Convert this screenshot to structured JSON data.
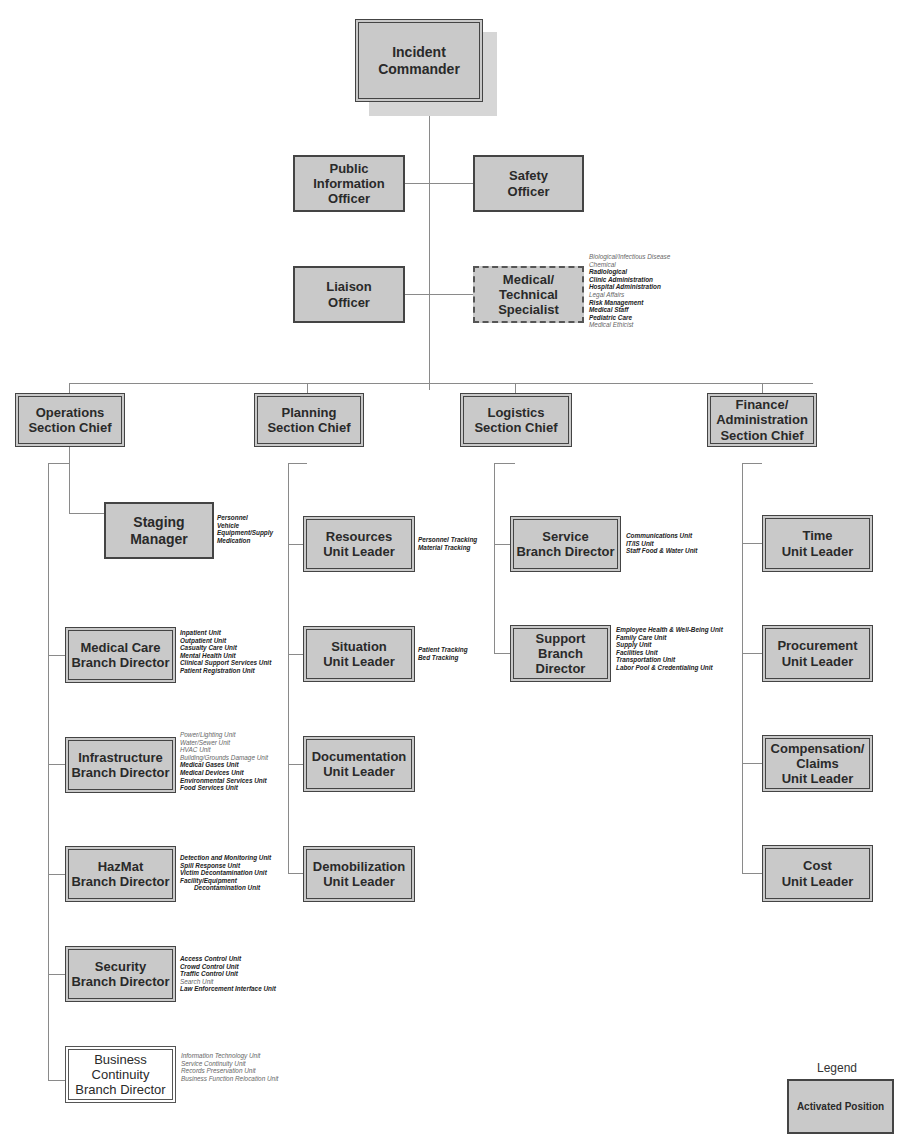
{
  "chart_title": "Hospital Incident Command System Organization Chart",
  "command": {
    "incident_commander": "Incident Commander",
    "public_information_officer": "Public\nInformation\nOfficer",
    "safety_officer": "Safety\nOfficer",
    "liaison_officer": "Liaison\nOfficer",
    "medical_technical_specialist": "Medical/\nTechnical\nSpecialist",
    "specialist_notes": [
      {
        "text": "Biological/Infectious Disease",
        "bold": false
      },
      {
        "text": "Chemical",
        "bold": false
      },
      {
        "text": "Radiological",
        "bold": true
      },
      {
        "text": "Clinic Administration",
        "bold": true
      },
      {
        "text": "Hospital Administration",
        "bold": true
      },
      {
        "text": "Legal Affairs",
        "bold": false
      },
      {
        "text": "Risk Management",
        "bold": true
      },
      {
        "text": "Medical Staff",
        "bold": true
      },
      {
        "text": "Pediatric Care",
        "bold": true
      },
      {
        "text": "Medical Ethicist",
        "bold": false
      }
    ]
  },
  "sections": {
    "operations": "Operations\nSection Chief",
    "planning": "Planning\nSection Chief",
    "logistics": "Logistics\nSection Chief",
    "finance": "Finance/\nAdministration\nSection Chief"
  },
  "operations": {
    "staging": {
      "label": "Staging\nManager",
      "notes": [
        {
          "text": "Personnel",
          "bold": true
        },
        {
          "text": "Vehicle",
          "bold": true
        },
        {
          "text": "Equipment/Supply",
          "bold": true
        },
        {
          "text": "Medication",
          "bold": true
        }
      ]
    },
    "medical_care": {
      "label": "Medical Care\nBranch Director",
      "notes": [
        {
          "text": "Inpatient Unit",
          "bold": true
        },
        {
          "text": "Outpatient Unit",
          "bold": true
        },
        {
          "text": "Casualty Care Unit",
          "bold": true
        },
        {
          "text": "Mental Health Unit",
          "bold": true
        },
        {
          "text": "Clinical Support Services Unit",
          "bold": true
        },
        {
          "text": "Patient Registration Unit",
          "bold": true
        }
      ]
    },
    "infrastructure": {
      "label": "Infrastructure\nBranch Director",
      "notes": [
        {
          "text": "Power/Lighting Unit",
          "bold": false
        },
        {
          "text": "Water/Sewer Unit",
          "bold": false
        },
        {
          "text": "HVAC Unit",
          "bold": false
        },
        {
          "text": "Building/Grounds Damage Unit",
          "bold": false
        },
        {
          "text": "Medical Gases Unit",
          "bold": true
        },
        {
          "text": "Medical Devices Unit",
          "bold": true
        },
        {
          "text": "Environmental Services Unit",
          "bold": true
        },
        {
          "text": "Food Services Unit",
          "bold": true
        }
      ]
    },
    "hazmat": {
      "label": "HazMat\nBranch Director",
      "notes": [
        {
          "text": "Detection and Monitoring Unit",
          "bold": true
        },
        {
          "text": "Spill Response Unit",
          "bold": true
        },
        {
          "text": "Victim Decontamination Unit",
          "bold": true
        },
        {
          "text": "Facility/Equipment",
          "bold": true
        },
        {
          "text": "Decontamination Unit",
          "bold": true,
          "indent": true
        }
      ]
    },
    "security": {
      "label": "Security\nBranch Director",
      "notes": [
        {
          "text": "Access Control Unit",
          "bold": true
        },
        {
          "text": "Crowd Control Unit",
          "bold": true
        },
        {
          "text": "Traffic Control Unit",
          "bold": true
        },
        {
          "text": "Search Unit",
          "bold": false
        },
        {
          "text": "Law Enforcement Interface Unit",
          "bold": true
        }
      ]
    },
    "business_continuity": {
      "label": "Business\nContinuity\nBranch Director",
      "notes": [
        {
          "text": "Information Technology Unit",
          "bold": false
        },
        {
          "text": "Service Continuity Unit",
          "bold": false
        },
        {
          "text": "Records Preservation Unit",
          "bold": false
        },
        {
          "text": "Business Function Relocation Unit",
          "bold": false
        }
      ]
    }
  },
  "planning": {
    "resources": {
      "label": "Resources\nUnit Leader",
      "notes": [
        {
          "text": "Personnel Tracking",
          "bold": true
        },
        {
          "text": "Material Tracking",
          "bold": true
        }
      ]
    },
    "situation": {
      "label": "Situation\nUnit Leader",
      "notes": [
        {
          "text": "Patient Tracking",
          "bold": true
        },
        {
          "text": "Bed Tracking",
          "bold": true
        }
      ]
    },
    "documentation": {
      "label": "Documentation\nUnit Leader"
    },
    "demobilization": {
      "label": "Demobilization\nUnit Leader"
    }
  },
  "logistics": {
    "service": {
      "label": "Service\nBranch Director",
      "notes": [
        {
          "text": "Communications Unit",
          "bold": true
        },
        {
          "text": "IT/IS Unit",
          "bold": true
        },
        {
          "text": "Staff Food & Water Unit",
          "bold": true
        }
      ]
    },
    "support": {
      "label": "Support\nBranch\nDirector",
      "notes": [
        {
          "text": "Employee Health & Well-Being Unit",
          "bold": true
        },
        {
          "text": "Family Care Unit",
          "bold": true
        },
        {
          "text": "Supply Unit",
          "bold": true
        },
        {
          "text": "Facilities Unit",
          "bold": true
        },
        {
          "text": "Transportation Unit",
          "bold": true
        },
        {
          "text": "Labor Pool & Credentialing Unit",
          "bold": true
        }
      ]
    }
  },
  "finance": {
    "time": {
      "label": "Time\nUnit Leader"
    },
    "procurement": {
      "label": "Procurement\nUnit Leader"
    },
    "compensation": {
      "label": "Compensation/\nClaims\nUnit Leader"
    },
    "cost": {
      "label": "Cost\nUnit Leader"
    }
  },
  "legend": {
    "title": "Legend",
    "activated_label": "Activated Position"
  },
  "colors": {
    "activated_fill": "#c9c9c9",
    "border": "#444444",
    "connector": "#8a8a8a",
    "inactive_fill": "#ffffff"
  }
}
